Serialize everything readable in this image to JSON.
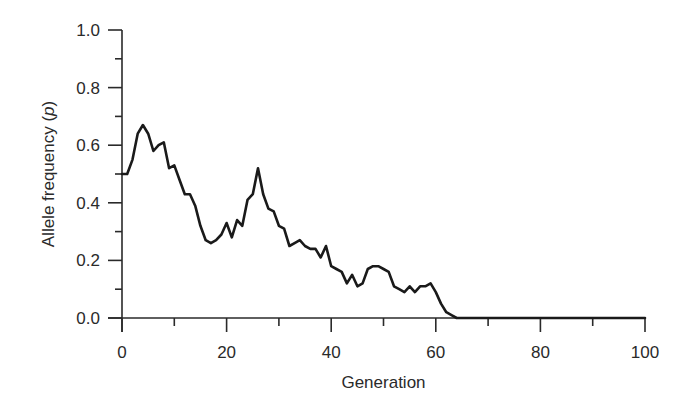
{
  "chart_data": {
    "type": "line",
    "title": "",
    "xlabel": "Generation",
    "ylabel": "Allele frequency (p)",
    "ylabel_parts": {
      "text": "Allele frequency (",
      "var": "p",
      "close": ")"
    },
    "xlim": [
      0,
      100
    ],
    "ylim": [
      0.0,
      1.0
    ],
    "grid": false,
    "legend": null,
    "x_ticks": [
      0,
      20,
      40,
      60,
      80,
      100
    ],
    "x_tick_labels": [
      "0",
      "20",
      "40",
      "60",
      "80",
      "100"
    ],
    "x_minor_ticks": [
      10,
      30,
      50,
      70,
      90
    ],
    "y_ticks": [
      0.0,
      0.2,
      0.4,
      0.6,
      0.8,
      1.0
    ],
    "y_tick_labels": [
      "0.0",
      "0.2",
      "0.4",
      "0.6",
      "0.8",
      "1.0"
    ],
    "y_minor_ticks": [
      0.1,
      0.3,
      0.5,
      0.7,
      0.9
    ],
    "series": [
      {
        "name": "p",
        "color": "#1a1a1a",
        "x": [
          0,
          1,
          2,
          3,
          4,
          5,
          6,
          7,
          8,
          9,
          10,
          11,
          12,
          13,
          14,
          15,
          16,
          17,
          18,
          19,
          20,
          21,
          22,
          23,
          24,
          25,
          26,
          27,
          28,
          29,
          30,
          31,
          32,
          33,
          34,
          35,
          36,
          37,
          38,
          39,
          40,
          41,
          42,
          43,
          44,
          45,
          46,
          47,
          48,
          49,
          50,
          51,
          52,
          53,
          54,
          55,
          56,
          57,
          58,
          59,
          60,
          61,
          62,
          63,
          64,
          65,
          70,
          80,
          90,
          100
        ],
        "values": [
          0.5,
          0.5,
          0.55,
          0.64,
          0.67,
          0.64,
          0.58,
          0.6,
          0.61,
          0.52,
          0.53,
          0.48,
          0.43,
          0.43,
          0.39,
          0.32,
          0.27,
          0.26,
          0.27,
          0.29,
          0.33,
          0.28,
          0.34,
          0.32,
          0.41,
          0.43,
          0.52,
          0.43,
          0.38,
          0.37,
          0.32,
          0.31,
          0.25,
          0.26,
          0.27,
          0.25,
          0.24,
          0.24,
          0.21,
          0.25,
          0.18,
          0.17,
          0.16,
          0.12,
          0.15,
          0.11,
          0.12,
          0.17,
          0.18,
          0.18,
          0.17,
          0.16,
          0.11,
          0.1,
          0.09,
          0.11,
          0.09,
          0.11,
          0.11,
          0.12,
          0.09,
          0.05,
          0.02,
          0.01,
          0.0,
          0.0,
          0.0,
          0.0,
          0.0,
          0.0
        ]
      }
    ]
  }
}
